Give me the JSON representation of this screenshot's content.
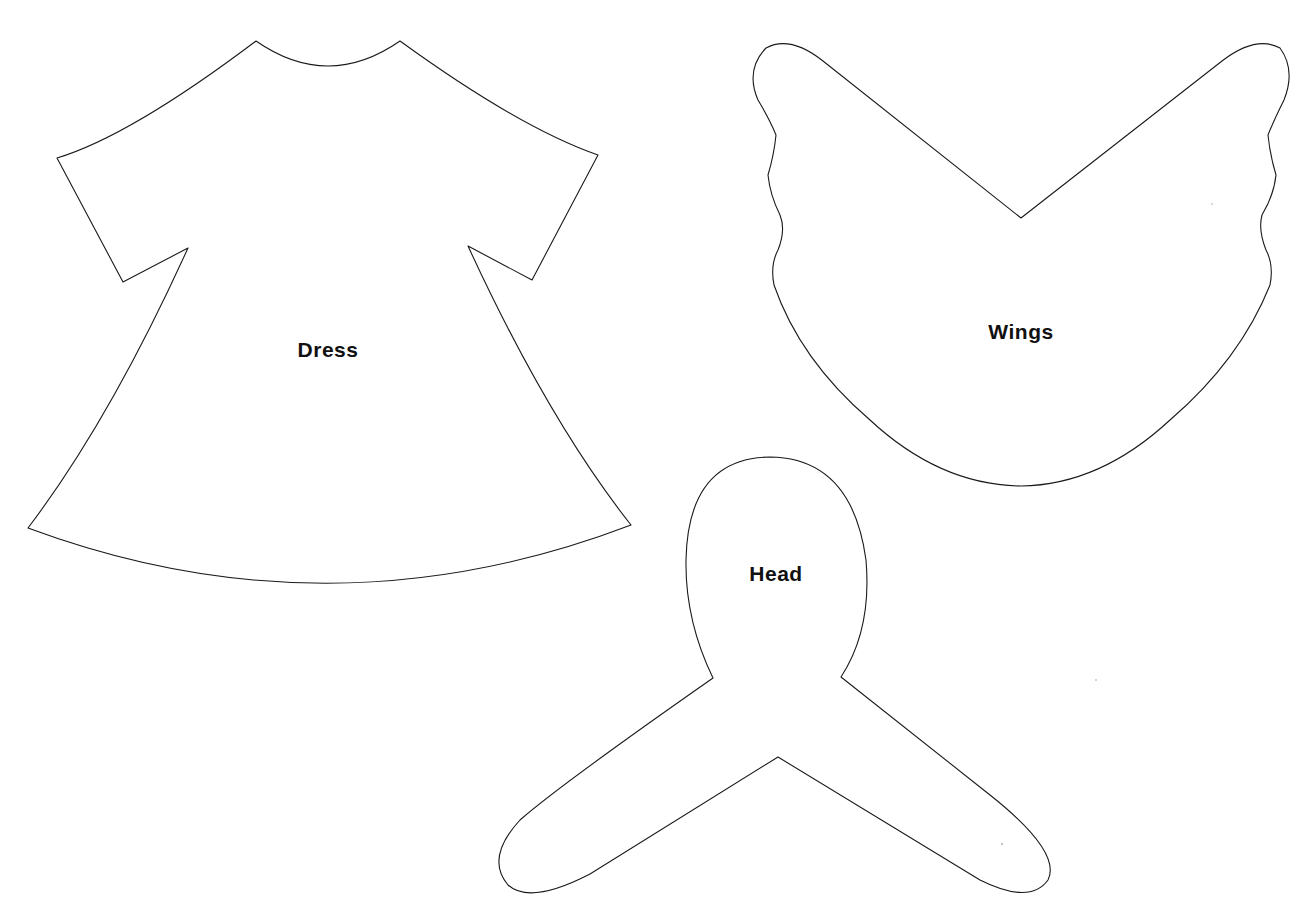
{
  "page": {
    "background": "#ffffff",
    "line_color": "#1a1a1a"
  },
  "pieces": [
    {
      "id": "dress",
      "label": "Dress"
    },
    {
      "id": "wings",
      "label": "Wings"
    },
    {
      "id": "head",
      "label": "Head"
    }
  ]
}
